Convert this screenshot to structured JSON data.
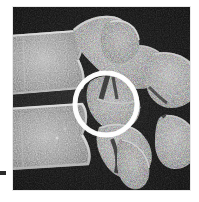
{
  "figure": {
    "kind": "medical-radiograph",
    "modality_label": "sagittal spine radiograph",
    "background_color": "#ffffff",
    "panel_color": "#0b0b0b",
    "panel": {
      "x": 13,
      "y": 7,
      "width": 177,
      "height": 183
    }
  },
  "annotation": {
    "shape": "circle",
    "color": "#ffffff",
    "center_x": 106,
    "center_y": 104,
    "radius": 31,
    "stroke_width": 5,
    "label": ""
  },
  "edge_mark": {
    "color": "#2b2b2b",
    "x": 0,
    "y": 171,
    "width": 6,
    "height": 4
  },
  "anatomy": {
    "structures": [
      {
        "name": "upper-vertebral-body",
        "tone": "#8e8e8e"
      },
      {
        "name": "lower-vertebral-body",
        "tone": "#8a8a8a"
      },
      {
        "name": "intervertebral-disc-space",
        "tone": "#1a1a1a"
      },
      {
        "name": "superior-posterior-element",
        "tone": "#7d7d7d"
      },
      {
        "name": "facet-joint-complex",
        "tone": "#757575"
      },
      {
        "name": "spinous-process",
        "tone": "#6f6f6f"
      },
      {
        "name": "inferior-posterior-element",
        "tone": "#787878"
      },
      {
        "name": "right-lateral-process",
        "tone": "#6b6b6b"
      }
    ]
  }
}
